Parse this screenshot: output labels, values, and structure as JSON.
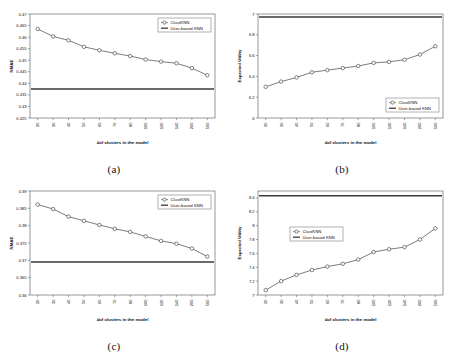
{
  "figure": {
    "panels": [
      "a",
      "b",
      "c",
      "d"
    ],
    "captions": {
      "a": "(a)",
      "b": "(b)",
      "c": "(c)",
      "d": "(d)"
    },
    "xlabel": "#of clusters in the model",
    "legend": {
      "series": "ClustKNN",
      "reference": "User-based KNN"
    },
    "colors": {
      "series": "#444444",
      "reference": "#3a3a3a",
      "frame": "#555555",
      "marker_fill": "#ffffff"
    }
  },
  "chart_data": [
    {
      "id": "a",
      "type": "line",
      "title": "",
      "xlabel": "#of clusters in the model",
      "ylabel": "NMAE",
      "categories": [
        "20",
        "30",
        "40",
        "50",
        "60",
        "70",
        "80",
        "100",
        "120",
        "140",
        "200",
        "500"
      ],
      "ylim": [
        0.425,
        0.47
      ],
      "yticks": [
        "0.425",
        "0.43",
        "0.435",
        "0.44",
        "0.445",
        "0.45",
        "0.455",
        "0.46",
        "0.465",
        "0.47"
      ],
      "grid": false,
      "legend_position": "top-right",
      "series": [
        {
          "name": "ClustKNN",
          "marker": "circle",
          "values": [
            0.4635,
            0.4603,
            0.4586,
            0.4558,
            0.4543,
            0.453,
            0.4518,
            0.4503,
            0.4494,
            0.4487,
            0.4466,
            0.4435
          ]
        },
        {
          "name": "User-based KNN",
          "type": "reference-line",
          "value": 0.4376
        }
      ]
    },
    {
      "id": "b",
      "type": "line",
      "title": "",
      "xlabel": "#of clusters in the model",
      "ylabel": "Expected Utility",
      "categories": [
        "20",
        "30",
        "40",
        "50",
        "60",
        "70",
        "80",
        "100",
        "120",
        "140",
        "200",
        "500"
      ],
      "ylim": [
        6,
        7
      ],
      "yticks": [
        "6",
        "6.2",
        "6.4",
        "6.6",
        "6.8",
        "7"
      ],
      "grid": false,
      "legend_position": "bottom-right",
      "series": [
        {
          "name": "ClustKNN",
          "marker": "circle",
          "values": [
            6.3,
            6.35,
            6.39,
            6.44,
            6.46,
            6.48,
            6.5,
            6.53,
            6.54,
            6.56,
            6.61,
            6.69
          ]
        },
        {
          "name": "User-based KNN",
          "type": "reference-line",
          "value": 6.97
        }
      ]
    },
    {
      "id": "c",
      "type": "line",
      "title": "",
      "xlabel": "#of clusters in the model",
      "ylabel": "NMAE",
      "categories": [
        "20",
        "30",
        "40",
        "50",
        "60",
        "70",
        "80",
        "100",
        "120",
        "140",
        "200",
        "500"
      ],
      "ylim": [
        0.36,
        0.39
      ],
      "yticks": [
        "0.36",
        "0.365",
        "0.37",
        "0.375",
        "0.38",
        "0.385",
        "0.39"
      ],
      "grid": false,
      "legend_position": "top-right",
      "series": [
        {
          "name": "ClustKNN",
          "marker": "circle",
          "values": [
            0.3861,
            0.3848,
            0.3826,
            0.3814,
            0.3802,
            0.3791,
            0.3782,
            0.3769,
            0.3756,
            0.3748,
            0.3734,
            0.3711
          ]
        },
        {
          "name": "User-based KNN",
          "type": "reference-line",
          "value": 0.3695
        }
      ]
    },
    {
      "id": "d",
      "type": "line",
      "title": "",
      "xlabel": "#of clusters in the model",
      "ylabel": "Expected Utility",
      "categories": [
        "20",
        "30",
        "40",
        "50",
        "60",
        "70",
        "80",
        "100",
        "120",
        "140",
        "200",
        "500"
      ],
      "ylim": [
        7,
        8.5
      ],
      "yticks": [
        "7",
        "7.2",
        "7.4",
        "7.6",
        "7.8",
        "8",
        "8.2",
        "8.4"
      ],
      "grid": false,
      "legend_position": "upper-left",
      "series": [
        {
          "name": "ClustKNN",
          "marker": "circle",
          "values": [
            7.07,
            7.2,
            7.29,
            7.36,
            7.41,
            7.45,
            7.51,
            7.62,
            7.66,
            7.69,
            7.8,
            7.96
          ]
        },
        {
          "name": "User-based KNN",
          "type": "reference-line",
          "value": 8.43
        }
      ]
    }
  ]
}
